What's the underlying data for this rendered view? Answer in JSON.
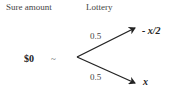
{
  "headers": {
    "sure_amount": "Sure amount",
    "lottery": "Lottery"
  },
  "sure_value": "$0",
  "equivalence_symbol": "~",
  "branches": [
    {
      "probability": "0.5",
      "outcome": "- x/2"
    },
    {
      "probability": "0.5",
      "outcome": "x"
    }
  ]
}
